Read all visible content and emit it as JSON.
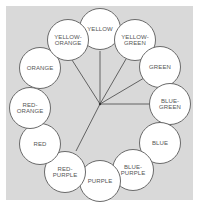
{
  "diagram": {
    "type": "color-wheel",
    "background_color": "#d9d9d9",
    "circle_fill": "#ffffff",
    "line_color": "#555555",
    "center": [
      100,
      104
    ],
    "colors": [
      {
        "label": "YELLOW",
        "cx": 100,
        "cy": 29
      },
      {
        "label": "YELLOW-\nGREEN",
        "cx": 135,
        "cy": 40
      },
      {
        "label": "GREEN",
        "cx": 160,
        "cy": 67
      },
      {
        "label": "BLUE-\nGREEN",
        "cx": 170,
        "cy": 104
      },
      {
        "label": "BLUE",
        "cx": 160,
        "cy": 143
      },
      {
        "label": "BLUE-\nPURPLE",
        "cx": 133,
        "cy": 170
      },
      {
        "label": "PURPLE",
        "cx": 100,
        "cy": 181
      },
      {
        "label": "RED-\nPURPLE",
        "cx": 65,
        "cy": 172
      },
      {
        "label": "RED",
        "cx": 40,
        "cy": 144
      },
      {
        "label": "RED-\nORANGE",
        "cx": 30,
        "cy": 108
      },
      {
        "label": "ORANGE",
        "cx": 40,
        "cy": 68
      },
      {
        "label": "YELLOW-\nORANGE",
        "cx": 68,
        "cy": 40
      }
    ],
    "spokes_to": [
      "YELLOW-ORANGE",
      "YELLOW",
      "YELLOW-GREEN",
      "GREEN",
      "BLUE-GREEN",
      "RED-PURPLE"
    ]
  }
}
